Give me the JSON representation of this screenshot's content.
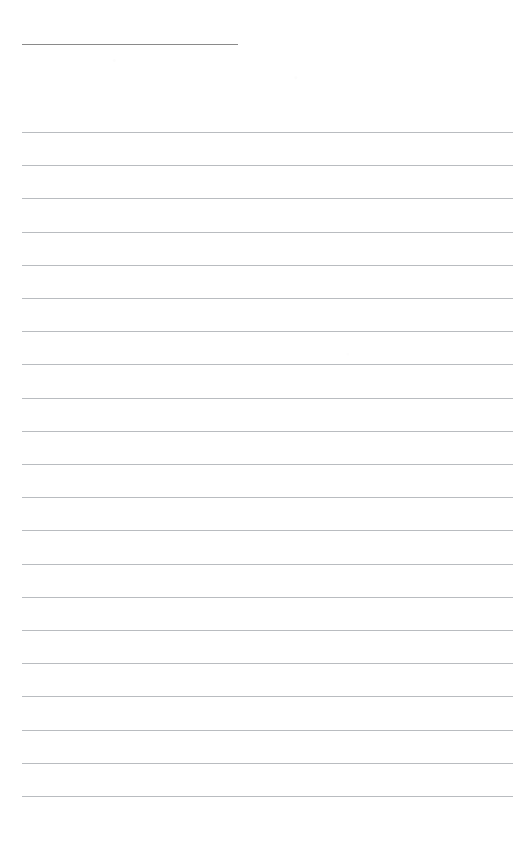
{
  "page": {
    "background_color": "#ffffff",
    "width": 519,
    "height": 864,
    "title_text": "",
    "body_text": ""
  },
  "field_rule": {
    "name": "title-field-rule",
    "color": "#8a8a8a",
    "left": 22,
    "top": 44,
    "width": 216,
    "thickness": 1,
    "value": "",
    "placeholder": ""
  },
  "ruled_lines": {
    "color": "#b9bcc0",
    "left": 22,
    "right": 513,
    "width": 491,
    "thickness": 1,
    "first_top": 132,
    "spacing": 33.2,
    "count": 21,
    "tops": [
      132.0,
      165.2,
      198.4,
      231.6,
      264.8,
      298.0,
      331.2,
      364.4,
      397.6,
      430.8,
      464.0,
      497.2,
      530.4,
      563.6,
      596.8,
      630.0,
      663.2,
      696.4,
      729.6,
      762.8,
      796.0
    ],
    "line_values": [
      "",
      "",
      "",
      "",
      "",
      "",
      "",
      "",
      "",
      "",
      "",
      "",
      "",
      "",
      "",
      "",
      "",
      "",
      "",
      "",
      ""
    ]
  }
}
